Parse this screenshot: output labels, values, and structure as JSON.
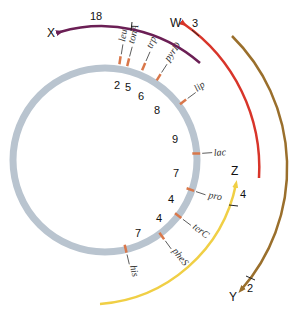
{
  "diagram": {
    "type": "circular-genetic-map",
    "colors": {
      "chromosome": "#b9c4cf",
      "marker": "#d9774a",
      "arc_X": "#6b1f55",
      "arc_W": "#d8352a",
      "arc_Y": "#9a6f2c",
      "arc_Z": "#f0cf45"
    },
    "genes": [
      {
        "name": "leu",
        "angle": 9
      },
      {
        "name": "tonA",
        "angle": 14
      },
      {
        "name": "trp",
        "angle": 23
      },
      {
        "name": "pyrD",
        "angle": 35
      },
      {
        "name": "lip",
        "angle": 54
      },
      {
        "name": "lac",
        "angle": 86
      },
      {
        "name": "pro",
        "angle": 109
      },
      {
        "name": "terC",
        "angle": 127
      },
      {
        "name": "pheS",
        "angle": 142
      },
      {
        "name": "his",
        "angle": 167
      }
    ],
    "intervals": [
      "2",
      "5",
      "6",
      "8",
      "9",
      "7",
      "4",
      "4",
      "7"
    ],
    "transfer_arcs": [
      {
        "label": "X",
        "distance": "18"
      },
      {
        "label": "W",
        "distance": "3"
      },
      {
        "label": "Y",
        "distance": "2"
      },
      {
        "label": "Z",
        "distance": "4"
      }
    ]
  }
}
